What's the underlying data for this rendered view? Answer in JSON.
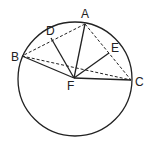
{
  "diagram": {
    "circle": {
      "cx": 75,
      "cy": 79,
      "r": 57
    },
    "points": {
      "A": {
        "label": "A",
        "x": 85,
        "y": 24
      },
      "B": {
        "label": "B",
        "x": 22,
        "y": 56
      },
      "C": {
        "label": "C",
        "x": 131,
        "y": 80
      },
      "D": {
        "label": "D",
        "x": 51,
        "y": 38
      },
      "E": {
        "label": "E",
        "x": 109,
        "y": 53
      },
      "F": {
        "label": "F",
        "x": 74,
        "y": 78
      }
    },
    "solid_segments": [
      "AF",
      "BF",
      "CF",
      "DF",
      "EF"
    ],
    "dashed_segments": [
      "AB",
      "AC",
      "BC"
    ],
    "stroke_color": "#222222"
  }
}
